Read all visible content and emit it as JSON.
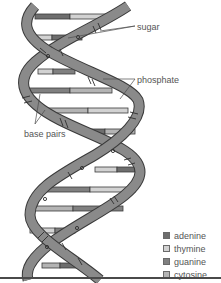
{
  "diagram": {
    "labels": {
      "sugar": "sugar",
      "phosphate": "phosphate",
      "base_pairs": "base pairs"
    },
    "legend": [
      {
        "name": "adenine",
        "color": "#6e6e6e"
      },
      {
        "name": "thymine",
        "color": "#d2d2d2"
      },
      {
        "name": "guanine",
        "color": "#808080"
      },
      {
        "name": "cytosine",
        "color": "#b4b4b4"
      }
    ],
    "colors": {
      "backbone": "#8a8a8a",
      "backbone_stroke": "#3a3a3a",
      "line": "#4a4a4a"
    }
  }
}
